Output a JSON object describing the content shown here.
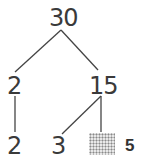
{
  "tree": {
    "root": "30",
    "level1": [
      "2",
      "15"
    ],
    "level2": [
      "2",
      "3"
    ],
    "hidden_label": "5"
  },
  "colors": {
    "line": "#444444",
    "text": "#3a3a3a"
  }
}
